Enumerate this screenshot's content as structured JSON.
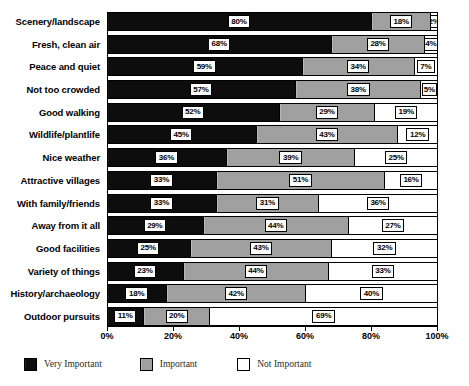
{
  "chart_data": {
    "type": "bar",
    "orientation": "horizontal",
    "stacked": true,
    "stacked_normalized": true,
    "title": "",
    "subtitle": "",
    "xlabel": "",
    "ylabel": "",
    "xlim": [
      0,
      100
    ],
    "grid": false,
    "legend_position": "bottom-left",
    "axis_tick_labels": [
      "0%",
      "20%",
      "40%",
      "60%",
      "80%",
      "100%"
    ],
    "axis_tick_values": [
      0,
      20,
      40,
      60,
      80,
      100
    ],
    "categories": [
      "Scenery/landscape",
      "Fresh, clean air",
      "Peace and quiet",
      "Not too crowded",
      "Good walking",
      "Wildlife/plantlife",
      "Nice weather",
      "Attractive villages",
      "With family/friends",
      "Away from it all",
      "Good facilities",
      "Variety of things",
      "History/archaeology",
      "Outdoor pursuits"
    ],
    "series": [
      {
        "name": "Very Important",
        "color": "#0d0d0d",
        "values": [
          80,
          68,
          59,
          57,
          52,
          45,
          36,
          33,
          33,
          29,
          25,
          23,
          18,
          11
        ],
        "labels": [
          "80%",
          "68%",
          "59%",
          "57%",
          "52%",
          "45%",
          "36%",
          "33%",
          "33%",
          "29%",
          "25%",
          "23%",
          "18%",
          "11%"
        ]
      },
      {
        "name": "Important",
        "color": "#a8a8a8",
        "values": [
          18,
          28,
          34,
          38,
          29,
          43,
          39,
          51,
          31,
          44,
          43,
          44,
          42,
          20
        ],
        "labels": [
          "18%",
          "28%",
          "34%",
          "38%",
          "29%",
          "43%",
          "39%",
          "51%",
          "31%",
          "44%",
          "43%",
          "44%",
          "42%",
          "20%"
        ]
      },
      {
        "name": "Not Important",
        "color": "#ffffff",
        "values": [
          2,
          4,
          7,
          5,
          19,
          12,
          25,
          16,
          36,
          27,
          32,
          33,
          40,
          69
        ],
        "labels": [
          "2%",
          "4%",
          "7%",
          "5%",
          "19%",
          "12%",
          "25%",
          "16%",
          "36%",
          "27%",
          "32%",
          "33%",
          "40%",
          "69%"
        ]
      }
    ]
  },
  "legend": {
    "items": [
      {
        "label": "Very Important",
        "color": "#0d0d0d"
      },
      {
        "label": "Important",
        "color": "#a8a8a8"
      },
      {
        "label": "Not Important",
        "color": "#ffffff"
      }
    ]
  }
}
